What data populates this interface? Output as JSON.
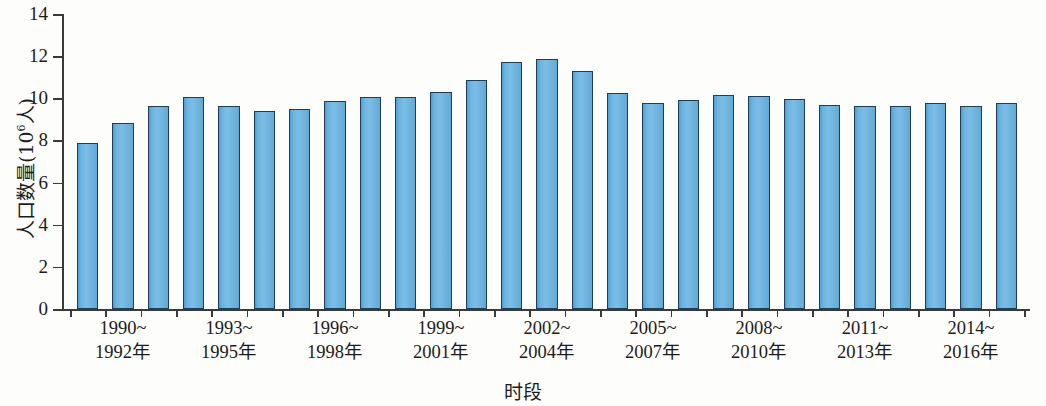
{
  "chart_data": {
    "type": "bar",
    "title": "",
    "xlabel": "时段",
    "ylabel": "人口数量(10⁶人)",
    "ylabel_base": "人口数量(10",
    "ylabel_exponent": "6",
    "ylabel_tail": "人)",
    "ylim": [
      0,
      14
    ],
    "ytick_values": [
      0,
      2,
      4,
      6,
      8,
      10,
      12,
      14
    ],
    "ytick_labels": [
      "0",
      "2",
      "4",
      "6",
      "8",
      "10",
      "12",
      "14"
    ],
    "grid": false,
    "legend": null,
    "bar_color": "#6fb4de",
    "bar_edge_color": "#1f3d56",
    "categories": [
      "1990",
      "1991",
      "1992",
      "1993",
      "1994",
      "1995",
      "1996",
      "1997",
      "1998",
      "1999",
      "2000",
      "2001",
      "2002",
      "2003",
      "2004",
      "2005",
      "2006",
      "2007",
      "2008",
      "2009",
      "2010",
      "2011",
      "2012",
      "2013",
      "2014",
      "2015",
      "2016"
    ],
    "values": [
      7.9,
      8.85,
      9.65,
      10.05,
      9.65,
      9.4,
      9.5,
      9.85,
      10.05,
      10.05,
      10.3,
      10.85,
      11.7,
      11.85,
      11.3,
      10.25,
      9.8,
      9.9,
      10.15,
      10.1,
      9.95,
      9.7,
      9.65,
      9.65,
      9.8,
      9.65,
      9.8
    ],
    "xtick_groups": [
      {
        "line1": "1990~",
        "line2": "1992年"
      },
      {
        "line1": "1993~",
        "line2": "1995年"
      },
      {
        "line1": "1996~",
        "line2": "1998年"
      },
      {
        "line1": "1999~",
        "line2": "2001年"
      },
      {
        "line1": "2002~",
        "line2": "2004年"
      },
      {
        "line1": "2005~",
        "line2": "2007年"
      },
      {
        "line1": "2008~",
        "line2": "2010年"
      },
      {
        "line1": "2011~",
        "line2": "2013年"
      },
      {
        "line1": "2014~",
        "line2": "2016年"
      }
    ]
  }
}
